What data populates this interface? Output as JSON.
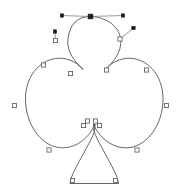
{
  "app": {
    "title": "Club Shape Path Editor",
    "canvas_label": "vector-canvas",
    "background_color": "#ffffff",
    "width": 188,
    "height": 193
  },
  "style": {
    "path_stroke_color": "#4a4a52",
    "path_stroke_width": 0.85,
    "handle_line_color": "#8c8c94",
    "anchor_fill_color": "#ffffff",
    "anchor_stroke_color": "#55555e",
    "selected_anchor_color": "#1b1b20",
    "handle_dot_color": "#1b1b20"
  },
  "shape": {
    "name": "club-clover-outline",
    "path_d": "M 90.5 16.5 C 104 16.8 118.5 24.5 120.5 38.5 C 122.5 52.5 112.5 62.5 105.5 69.5 C 112 61 124 57 133 58.5 C 150 61 163 77 163 99 C 163 124 148 145 130 147.5 C 113 150 98.5 137 93.5 124 C 93.3 128.5 94.3 132 95.3 134.6 C 97.5 140.5 105 153 112 166.5 C 116 174 118 179 118.5 183.5 L 70 183.5 C 70.5 179 72.5 174 76.5 166.5 C 83.5 153 91 140.5 93.2 134.6 C 94.2 132 95.2 128.5 95 124 C 90 137 75.5 150 58.5 147.5 C 40.5 145 25.5 124 25.5 99 C 25.5 77 38.5 61 55.5 58.5 C 64.5 57 76.5 61 83 69.5 C 76 62.5 66 52.5 68 38.5 C 70 24.5 77 16.2 90.5 16.5 Z",
    "anchors": [
      {
        "id": "a1",
        "label": "top-center-anchor",
        "x": 90.5,
        "y": 16.5,
        "selected": true
      },
      {
        "id": "a2",
        "label": "upper-right-anchor",
        "x": 120.0,
        "y": 39.0,
        "selected": false
      },
      {
        "id": "a3",
        "label": "right-notch-anchor",
        "x": 106.5,
        "y": 70.0,
        "selected": false
      },
      {
        "id": "a4",
        "label": "right-lobe-top-anchor",
        "x": 146.5,
        "y": 70.0,
        "selected": false
      },
      {
        "id": "a5",
        "label": "right-lobe-side-anchor",
        "x": 166.5,
        "y": 105.5,
        "selected": false
      },
      {
        "id": "a6",
        "label": "right-lobe-bottom-anchor",
        "x": 137.0,
        "y": 150.0,
        "selected": false
      },
      {
        "id": "a7",
        "label": "stem-right-inner-anchor",
        "x": 99.5,
        "y": 125.5,
        "selected": false
      },
      {
        "id": "a8",
        "label": "stem-right-top-anchor",
        "x": 95.5,
        "y": 121.0,
        "selected": false
      },
      {
        "id": "a9",
        "label": "stem-left-top-anchor",
        "x": 87.5,
        "y": 121.0,
        "selected": false
      },
      {
        "id": "a10",
        "label": "stem-left-inner-anchor",
        "x": 83.5,
        "y": 125.5,
        "selected": false
      },
      {
        "id": "a11",
        "label": "stem-bottom-right-anchor",
        "x": 115.5,
        "y": 180.5,
        "selected": false
      },
      {
        "id": "a12",
        "label": "stem-bottom-left-anchor",
        "x": 72.5,
        "y": 180.5,
        "selected": false
      },
      {
        "id": "a13",
        "label": "left-lobe-bottom-anchor",
        "x": 49.0,
        "y": 150.0,
        "selected": false
      },
      {
        "id": "a14",
        "label": "left-lobe-side-anchor",
        "x": 14.5,
        "y": 105.5,
        "selected": false
      },
      {
        "id": "a15",
        "label": "left-lobe-top-anchor",
        "x": 43.5,
        "y": 65.0,
        "selected": false
      },
      {
        "id": "a16",
        "label": "left-notch-anchor",
        "x": 70.5,
        "y": 73.5,
        "selected": false
      },
      {
        "id": "a17",
        "label": "upper-left-anchor",
        "x": 55.5,
        "y": 40.5,
        "selected": false
      }
    ],
    "handles": [
      {
        "id": "h1",
        "label": "top-center-left-handle",
        "anchor": {
          "x": 90.5,
          "y": 16.5
        },
        "point": {
          "x": 62.0,
          "y": 15.5
        }
      },
      {
        "id": "h2",
        "label": "top-center-right-handle",
        "anchor": {
          "x": 90.5,
          "y": 16.5
        },
        "point": {
          "x": 123.0,
          "y": 15.5
        }
      },
      {
        "id": "h3",
        "label": "upper-left-tangent-handle",
        "anchor": {
          "x": 55.5,
          "y": 40.5
        },
        "point": {
          "x": 55.0,
          "y": 31.5
        }
      },
      {
        "id": "h4",
        "label": "upper-right-tangent-handle",
        "anchor": {
          "x": 120.0,
          "y": 39.0
        },
        "point": {
          "x": 133.5,
          "y": 28.0
        }
      }
    ],
    "anchor_count": 17,
    "handle_count": 4,
    "selected_count": 1
  }
}
